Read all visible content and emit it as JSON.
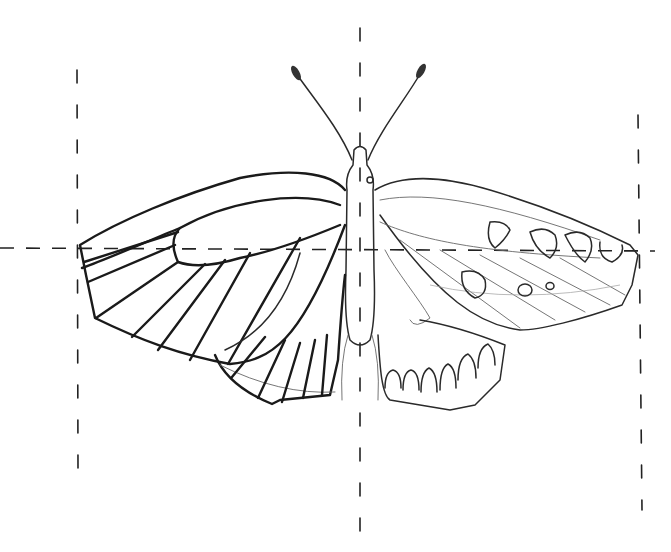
{
  "image": {
    "subject": "pencil sketch of a butterfly, top view, wings spread",
    "style": "line drawing, black pencil on white",
    "background_color": "#ffffff",
    "line_color": "#1a1a1a",
    "left_half": "heavy bold veins outlined",
    "right_half": "light sketch with wing markings and eyespots"
  },
  "guides": {
    "vertical_center_x": 360,
    "vertical_left_x": 77,
    "vertical_right_x": 640,
    "horizontal_y": 250,
    "style": "dashed"
  }
}
